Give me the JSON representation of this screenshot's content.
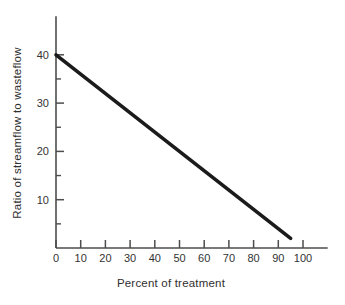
{
  "chart_data": {
    "type": "line",
    "title": "",
    "xlabel": "Percent of treatment",
    "ylabel": "Ratio of streamflow to wasteflow",
    "xlim": [
      0,
      110
    ],
    "ylim": [
      0,
      48
    ],
    "x_ticks": [
      0,
      10,
      20,
      30,
      40,
      50,
      60,
      70,
      80,
      90,
      100
    ],
    "y_ticks": [
      10,
      20,
      30,
      40
    ],
    "y_minor_ticks": [
      5,
      15,
      25,
      35
    ],
    "grid": false,
    "legend": "none",
    "series": [
      {
        "name": "streamflow-ratio-line",
        "x": [
          0,
          95
        ],
        "y": [
          40,
          2
        ]
      }
    ],
    "colors": {
      "line": "#1b1b1b",
      "axis": "#4d4d4d",
      "text": "#333333",
      "background": "#ffffff"
    }
  }
}
